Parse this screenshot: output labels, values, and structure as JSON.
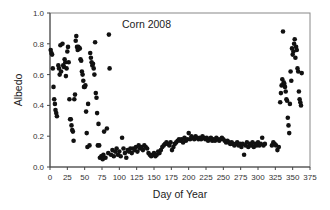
{
  "chart_data": {
    "type": "scatter",
    "title": "Corn 2008",
    "xlabel": "Day of Year",
    "ylabel": "Albedo",
    "xlim": [
      0,
      375
    ],
    "ylim": [
      0.0,
      1.0
    ],
    "x_ticks": [
      0,
      25,
      50,
      75,
      100,
      125,
      150,
      175,
      200,
      225,
      250,
      275,
      300,
      325,
      350,
      375
    ],
    "y_ticks": [
      0.0,
      0.2,
      0.4,
      0.6,
      0.8,
      1.0
    ],
    "y_tick_labels": [
      "0.0",
      "0.2",
      "0.4",
      "0.6",
      "0.8",
      "1.0"
    ],
    "grid": false,
    "legend": null,
    "marker_color": "#111111",
    "series": [
      {
        "name": "Albedo",
        "points": [
          [
            1,
            0.76
          ],
          [
            2,
            0.74
          ],
          [
            3,
            0.73
          ],
          [
            4,
            0.64
          ],
          [
            5,
            0.52
          ],
          [
            6,
            0.44
          ],
          [
            7,
            0.41
          ],
          [
            8,
            0.37
          ],
          [
            9,
            0.35
          ],
          [
            10,
            0.33
          ],
          [
            12,
            0.66
          ],
          [
            13,
            0.64
          ],
          [
            14,
            0.6
          ],
          [
            15,
            0.79
          ],
          [
            16,
            0.62
          ],
          [
            18,
            0.8
          ],
          [
            19,
            0.66
          ],
          [
            20,
            0.65
          ],
          [
            21,
            0.7
          ],
          [
            22,
            0.68
          ],
          [
            23,
            0.59
          ],
          [
            24,
            0.64
          ],
          [
            25,
            0.75
          ],
          [
            26,
            0.78
          ],
          [
            27,
            0.68
          ],
          [
            28,
            0.44
          ],
          [
            29,
            0.31
          ],
          [
            30,
            0.31
          ],
          [
            31,
            0.27
          ],
          [
            32,
            0.24
          ],
          [
            33,
            0.23
          ],
          [
            34,
            0.17
          ],
          [
            35,
            0.44
          ],
          [
            36,
            0.47
          ],
          [
            37,
            0.82
          ],
          [
            38,
            0.85
          ],
          [
            39,
            0.78
          ],
          [
            40,
            0.76
          ],
          [
            41,
            0.78
          ],
          [
            42,
            0.77
          ],
          [
            43,
            0.77
          ],
          [
            44,
            0.7
          ],
          [
            45,
            0.69
          ],
          [
            46,
            0.62
          ],
          [
            47,
            0.6
          ],
          [
            48,
            0.56
          ],
          [
            49,
            0.52
          ],
          [
            50,
            0.52
          ],
          [
            51,
            0.53
          ],
          [
            52,
            0.36
          ],
          [
            53,
            0.22
          ],
          [
            54,
            0.13
          ],
          [
            55,
            0.41
          ],
          [
            57,
            0.14
          ],
          [
            58,
            0.74
          ],
          [
            59,
            0.71
          ],
          [
            60,
            0.68
          ],
          [
            61,
            0.66
          ],
          [
            62,
            0.67
          ],
          [
            63,
            0.64
          ],
          [
            64,
            0.6
          ],
          [
            65,
            0.81
          ],
          [
            66,
            0.48
          ],
          [
            67,
            0.45
          ],
          [
            68,
            0.35
          ],
          [
            69,
            0.14
          ],
          [
            70,
            0.28
          ],
          [
            71,
            0.14
          ],
          [
            72,
            0.06
          ],
          [
            74,
            0.07
          ],
          [
            75,
            0.07
          ],
          [
            76,
            0.05
          ],
          [
            77,
            0.08
          ],
          [
            78,
            0.23
          ],
          [
            80,
            0.06
          ],
          [
            82,
            0.25
          ],
          [
            84,
            0.09
          ],
          [
            85,
            0.86
          ],
          [
            86,
            0.64
          ],
          [
            88,
            0.08
          ],
          [
            90,
            0.11
          ],
          [
            92,
            0.07
          ],
          [
            94,
            0.1
          ],
          [
            96,
            0.12
          ],
          [
            98,
            0.08
          ],
          [
            100,
            0.1
          ],
          [
            102,
            0.07
          ],
          [
            104,
            0.19
          ],
          [
            106,
            0.12
          ],
          [
            108,
            0.09
          ],
          [
            110,
            0.06
          ],
          [
            112,
            0.11
          ],
          [
            114,
            0.1
          ],
          [
            116,
            0.12
          ],
          [
            118,
            0.09
          ],
          [
            120,
            0.12
          ],
          [
            122,
            0.11
          ],
          [
            124,
            0.13
          ],
          [
            126,
            0.1
          ],
          [
            128,
            0.14
          ],
          [
            130,
            0.12
          ],
          [
            132,
            0.13
          ],
          [
            134,
            0.11
          ],
          [
            136,
            0.14
          ],
          [
            138,
            0.13
          ],
          [
            140,
            0.12
          ],
          [
            142,
            0.09
          ],
          [
            144,
            0.08
          ],
          [
            146,
            0.07
          ],
          [
            148,
            0.08
          ],
          [
            150,
            0.09
          ],
          [
            152,
            0.07
          ],
          [
            154,
            0.08
          ],
          [
            156,
            0.1
          ],
          [
            158,
            0.09
          ],
          [
            160,
            0.11
          ],
          [
            162,
            0.13
          ],
          [
            164,
            0.14
          ],
          [
            166,
            0.15
          ],
          [
            168,
            0.16
          ],
          [
            170,
            0.15
          ],
          [
            172,
            0.14
          ],
          [
            174,
            0.16
          ],
          [
            176,
            0.11
          ],
          [
            178,
            0.13
          ],
          [
            180,
            0.15
          ],
          [
            182,
            0.16
          ],
          [
            184,
            0.17
          ],
          [
            186,
            0.18
          ],
          [
            188,
            0.17
          ],
          [
            190,
            0.18
          ],
          [
            192,
            0.16
          ],
          [
            194,
            0.19
          ],
          [
            196,
            0.17
          ],
          [
            198,
            0.18
          ],
          [
            200,
            0.22
          ],
          [
            202,
            0.18
          ],
          [
            204,
            0.2
          ],
          [
            206,
            0.19
          ],
          [
            208,
            0.18
          ],
          [
            210,
            0.2
          ],
          [
            212,
            0.19
          ],
          [
            214,
            0.18
          ],
          [
            216,
            0.19
          ],
          [
            218,
            0.18
          ],
          [
            220,
            0.2
          ],
          [
            222,
            0.19
          ],
          [
            224,
            0.18
          ],
          [
            226,
            0.19
          ],
          [
            228,
            0.17
          ],
          [
            230,
            0.18
          ],
          [
            232,
            0.19
          ],
          [
            234,
            0.17
          ],
          [
            236,
            0.18
          ],
          [
            238,
            0.17
          ],
          [
            240,
            0.19
          ],
          [
            242,
            0.18
          ],
          [
            244,
            0.17
          ],
          [
            246,
            0.18
          ],
          [
            248,
            0.19
          ],
          [
            250,
            0.18
          ],
          [
            252,
            0.17
          ],
          [
            254,
            0.16
          ],
          [
            256,
            0.17
          ],
          [
            258,
            0.16
          ],
          [
            260,
            0.15
          ],
          [
            262,
            0.16
          ],
          [
            264,
            0.15
          ],
          [
            266,
            0.14
          ],
          [
            268,
            0.15
          ],
          [
            270,
            0.16
          ],
          [
            272,
            0.14
          ],
          [
            274,
            0.15
          ],
          [
            276,
            0.13
          ],
          [
            278,
            0.15
          ],
          [
            280,
            0.08
          ],
          [
            282,
            0.14
          ],
          [
            284,
            0.16
          ],
          [
            286,
            0.13
          ],
          [
            288,
            0.15
          ],
          [
            290,
            0.14
          ],
          [
            292,
            0.16
          ],
          [
            294,
            0.13
          ],
          [
            296,
            0.15
          ],
          [
            298,
            0.14
          ],
          [
            300,
            0.16
          ],
          [
            302,
            0.14
          ],
          [
            304,
            0.15
          ],
          [
            306,
            0.19
          ],
          [
            308,
            0.14
          ],
          [
            310,
            0.15
          ],
          [
            320,
            0.14
          ],
          [
            322,
            0.16
          ],
          [
            324,
            0.15
          ],
          [
            326,
            0.14
          ],
          [
            328,
            0.11
          ],
          [
            330,
            0.13
          ],
          [
            332,
            0.42
          ],
          [
            333,
            0.48
          ],
          [
            334,
            0.53
          ],
          [
            335,
            0.57
          ],
          [
            336,
            0.88
          ],
          [
            337,
            0.55
          ],
          [
            338,
            0.54
          ],
          [
            339,
            0.52
          ],
          [
            340,
            0.49
          ],
          [
            341,
            0.44
          ],
          [
            342,
            0.43
          ],
          [
            343,
            0.32
          ],
          [
            344,
            0.27
          ],
          [
            345,
            0.22
          ],
          [
            346,
            0.41
          ],
          [
            347,
            0.62
          ],
          [
            348,
            0.56
          ],
          [
            349,
            0.77
          ],
          [
            350,
            0.73
          ],
          [
            351,
            0.75
          ],
          [
            352,
            0.8
          ],
          [
            353,
            0.83
          ],
          [
            354,
            0.71
          ],
          [
            355,
            0.78
          ],
          [
            356,
            0.76
          ],
          [
            357,
            0.64
          ],
          [
            358,
            0.62
          ],
          [
            359,
            0.49
          ],
          [
            360,
            0.44
          ],
          [
            361,
            0.42
          ],
          [
            362,
            0.4
          ],
          [
            363,
            0.61
          ]
        ]
      }
    ]
  }
}
